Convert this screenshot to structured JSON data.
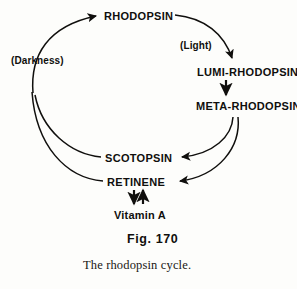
{
  "figure": {
    "number_label": "Fig.  170",
    "caption": "The rhodopsin cycle.",
    "ink_color": "#100f0d",
    "background_color": "#fdfdfb"
  },
  "diagram": {
    "title": "The rhodopsin cycle",
    "nodes": [
      {
        "id": "rhodopsin",
        "label": "RHODOPSIN"
      },
      {
        "id": "lumi_rhodopsin",
        "label": "LUMI-RHODOPSIN"
      },
      {
        "id": "meta_rhodopsin",
        "label": "META-RHODOPSIN"
      },
      {
        "id": "scotopsin",
        "label": "SCOTOPSIN"
      },
      {
        "id": "retinene",
        "label": "RETINENE"
      },
      {
        "id": "vitamin_a",
        "label": "Vitamin  A"
      }
    ],
    "condition_labels": [
      {
        "id": "darkness",
        "label": "(Darkness)"
      },
      {
        "id": "light",
        "label": "(Light)"
      }
    ],
    "edges": [
      {
        "from": "rhodopsin",
        "to": "lumi_rhodopsin",
        "condition": "(Light)",
        "style": "curved-arrow"
      },
      {
        "from": "lumi_rhodopsin",
        "to": "meta_rhodopsin",
        "style": "straight-arrow-down"
      },
      {
        "from": "meta_rhodopsin",
        "to": "scotopsin",
        "style": "curved-arrow"
      },
      {
        "from": "meta_rhodopsin",
        "to": "retinene",
        "style": "curved-arrow"
      },
      {
        "from": "scotopsin",
        "to": "rhodopsin",
        "condition": "(Darkness)",
        "style": "curved-arrow"
      },
      {
        "from": "retinene",
        "to": "rhodopsin",
        "condition": "(Darkness)",
        "style": "curved-arrow"
      },
      {
        "from": "retinene",
        "to": "vitamin_a",
        "style": "double-arrow-reversible"
      }
    ]
  }
}
